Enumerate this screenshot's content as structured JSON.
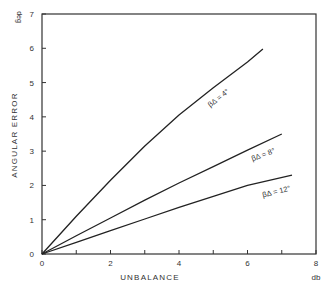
{
  "chart_data": {
    "type": "line",
    "title": "",
    "xlabel": "UNBALANCE",
    "xunit": "db",
    "ylabel": "ANGULAR ERROR",
    "yunit": "deg",
    "xlim": [
      0,
      8
    ],
    "ylim": [
      0,
      7
    ],
    "xticks": [
      0,
      2,
      4,
      6,
      8
    ],
    "yticks": [
      0,
      1,
      2,
      3,
      4,
      5,
      6,
      7
    ],
    "grid": false,
    "legend": "inline labels",
    "series": [
      {
        "name": "β_Δ = 4°",
        "label": "βΔ = 4°",
        "x": [
          0,
          1,
          2,
          3,
          4,
          5,
          6,
          6.45
        ],
        "y": [
          0,
          1.1,
          2.15,
          3.15,
          4.05,
          4.85,
          5.6,
          5.98
        ]
      },
      {
        "name": "β_Δ = 8°",
        "label": "βΔ = 8°",
        "x": [
          0,
          1,
          2,
          3,
          4,
          5,
          6,
          7.0
        ],
        "y": [
          0,
          0.53,
          1.05,
          1.57,
          2.07,
          2.55,
          3.03,
          3.5
        ]
      },
      {
        "name": "β_Δ = 12°",
        "label": "βΔ = 12°",
        "x": [
          0,
          1,
          2,
          3,
          4,
          5,
          6,
          7.3
        ],
        "y": [
          0,
          0.34,
          0.68,
          1.02,
          1.36,
          1.68,
          2.0,
          2.3
        ]
      }
    ]
  },
  "labels": {
    "xlabel": "UNBALANCE",
    "xunit": "db",
    "ylabel": "ANGULAR ERROR",
    "yunit": "deg"
  }
}
